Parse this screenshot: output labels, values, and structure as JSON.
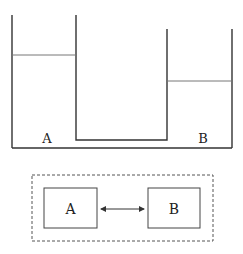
{
  "diagram": {
    "vessel": {
      "left_container_label": "A",
      "right_container_label": "B",
      "left_water_level_y": 55,
      "right_water_level_y": 81
    },
    "system": {
      "box_a_label": "A",
      "box_b_label": "B",
      "connection": "bidirectional-arrow",
      "boundary": "dashed"
    },
    "colors": {
      "line": "#333333",
      "water_line": "#666666",
      "background": "#ffffff"
    }
  }
}
